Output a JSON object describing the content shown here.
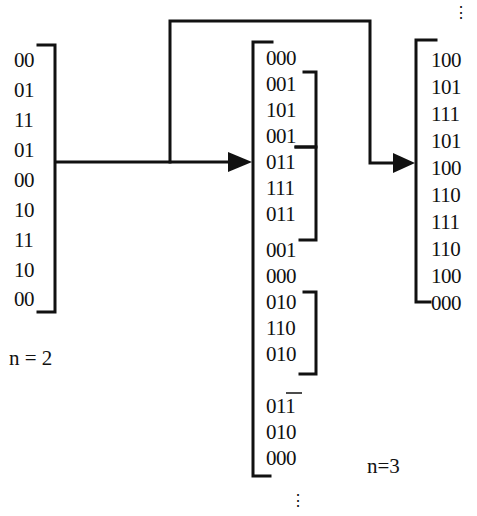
{
  "diagram": {
    "left_column": {
      "label": "n = 2",
      "rows": [
        "00",
        "01",
        "11",
        "01",
        "00",
        "10",
        "11",
        "10",
        "00"
      ]
    },
    "middle_column": {
      "label": "n=3",
      "rows": [
        "000",
        "001",
        "101",
        "001",
        "011",
        "111",
        "011",
        "001",
        "000",
        "010",
        "110",
        "010",
        "011",
        "010",
        "000"
      ],
      "sub_brackets": [
        {
          "from_row": 1,
          "to_row": 3
        },
        {
          "from_row": 4,
          "to_row": 6
        },
        {
          "from_row": 9,
          "to_row": 11
        }
      ],
      "continuation": "⋮"
    },
    "right_column": {
      "rows": [
        "100",
        "101",
        "111",
        "101",
        "100",
        "110",
        "111",
        "110",
        "100",
        "000"
      ],
      "continuation": "⋮"
    },
    "arrows": [
      {
        "from": "left_column",
        "to": "middle_column"
      },
      {
        "from": "left_column",
        "to": "right_column"
      }
    ],
    "colors": {
      "stroke": "#111111",
      "background": "#ffffff"
    }
  }
}
